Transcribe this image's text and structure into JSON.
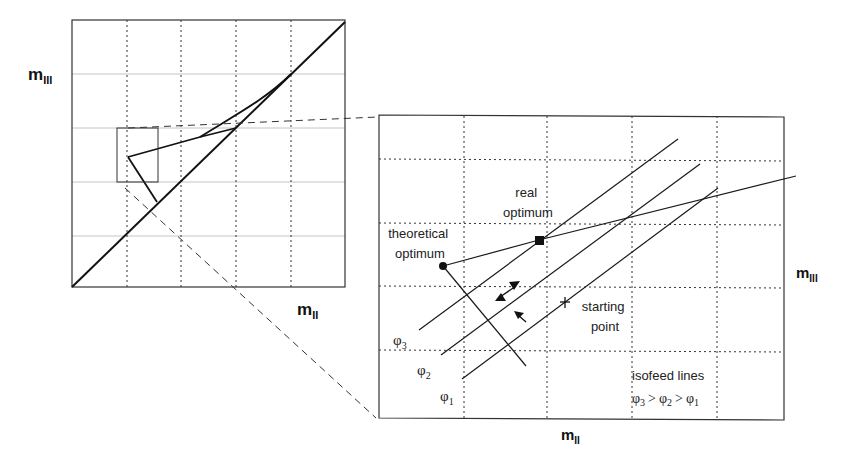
{
  "overview": {
    "x_label_main": "m",
    "x_label_sub": "II",
    "y_label_main": "m",
    "y_label_sub": "III"
  },
  "detail": {
    "x_label_main": "m",
    "x_label_sub": "II",
    "y_label_main": "m",
    "y_label_sub": "III",
    "real_optimum": [
      "real",
      "optimum"
    ],
    "theoretical_optimum": [
      "theoretical",
      "optimum"
    ],
    "starting_point": [
      "starting",
      "point"
    ],
    "isofeed_title": "isofeed lines",
    "phi_symbol": "φ",
    "phi_labels": [
      {
        "sub": "3"
      },
      {
        "sub": "2"
      },
      {
        "sub": "1"
      }
    ],
    "isofeed_order": {
      "a": "3",
      "b": "2",
      "c": "1",
      "op": ">"
    }
  },
  "colors": {
    "line": "#1a1a1a",
    "grid_dotted": "#333333",
    "grid_light": "#bbbbbb",
    "background": "#ffffff"
  }
}
